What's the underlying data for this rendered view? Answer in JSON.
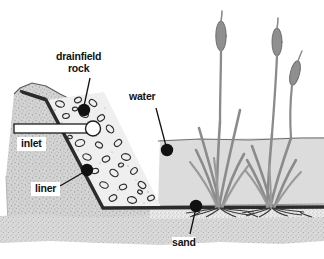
{
  "diagram": {
    "type": "cross-section-illustration",
    "background_color": "#ffffff",
    "labels": [
      {
        "id": "drainfield-rock",
        "text": "drainfield\nrock",
        "line1": "drainfield",
        "line2": "rock",
        "dot": true
      },
      {
        "id": "water",
        "text": "water",
        "dot": true
      },
      {
        "id": "inlet",
        "text": "inlet",
        "dot": false
      },
      {
        "id": "liner",
        "text": "liner",
        "dot": true
      },
      {
        "id": "sand",
        "text": "sand",
        "dot": true
      }
    ],
    "colors": {
      "soil": "#d2d2d2",
      "water": "#dcdcdc",
      "rock_fill": "#ededed",
      "sand": "#e8e8e8",
      "liner": "#2b2b2b",
      "ink": "#161616",
      "plant": "#8a8a8a",
      "label_text": "#111111"
    },
    "elements": {
      "soil_label": "soil",
      "water_label": "water body",
      "rock_band_label": "drainfield rock band",
      "sand_layer_label": "sand layer",
      "liner_label": "impermeable liner",
      "inlet_pipe_label": "inlet pipe",
      "plants_label": "cattail plants"
    }
  }
}
